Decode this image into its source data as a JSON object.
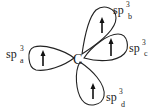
{
  "diagram": {
    "title": "",
    "center_atom": "C",
    "orbitals": [
      {
        "id": "a",
        "base": "sp",
        "superscript": "3",
        "subscript": "a",
        "electron": "up-arrow"
      },
      {
        "id": "b",
        "base": "sp",
        "superscript": "3",
        "subscript": "b",
        "electron": "up-arrow"
      },
      {
        "id": "c",
        "base": "sp",
        "superscript": "3",
        "subscript": "c",
        "electron": "up-arrow"
      },
      {
        "id": "d",
        "base": "sp",
        "superscript": "3",
        "subscript": "d",
        "electron": "up-arrow"
      }
    ],
    "colors": {
      "stroke": "#222222",
      "background": "#ffffff"
    }
  }
}
